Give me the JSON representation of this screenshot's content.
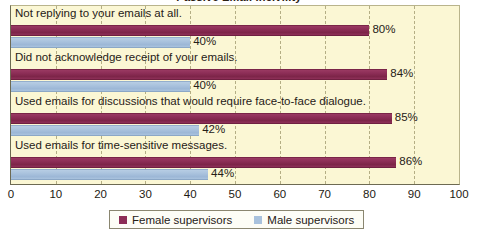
{
  "chart_data": {
    "type": "bar",
    "orientation": "horizontal",
    "title": "Passive Email Incivility",
    "xlabel": "",
    "ylabel": "",
    "xlim": [
      0,
      100
    ],
    "xticks": [
      "0",
      "10",
      "20",
      "30",
      "40",
      "50",
      "60",
      "70",
      "80",
      "90",
      "100"
    ],
    "grid": "vertical-dashed",
    "legend_position": "bottom-center",
    "categories": [
      "Not replying to your emails at all.",
      "Did not acknowledge receipt of your emails.",
      "Used emails for discussions that would require face-to-face dialogue.",
      "Used emails for time-sensitive messages."
    ],
    "series": [
      {
        "name": "Female supervisors",
        "color": "#8c2d56",
        "values": [
          80,
          84,
          85,
          86
        ],
        "value_labels": [
          "80%",
          "84%",
          "85%",
          "86%"
        ]
      },
      {
        "name": "Male supervisors",
        "color": "#a9c2dd",
        "values": [
          40,
          40,
          42,
          44
        ],
        "value_labels": [
          "40%",
          "40%",
          "42%",
          "44%"
        ]
      }
    ]
  },
  "legend": {
    "items": [
      {
        "label": "Female supervisors",
        "color": "#8c2d56"
      },
      {
        "label": "Male supervisors",
        "color": "#a9c2dd"
      }
    ]
  },
  "colors": {
    "plot_background": "#fbf7d4",
    "gridline": "#b4ae84",
    "axis": "#6d6a52",
    "text": "#262017",
    "female": "#8c2d56",
    "male": "#a9c2dd"
  }
}
